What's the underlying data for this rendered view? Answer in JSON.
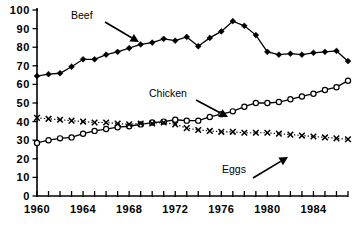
{
  "chart_data": {
    "type": "line",
    "title": "",
    "xlabel": "",
    "ylabel": "",
    "xlim": [
      1960,
      1987
    ],
    "ylim": [
      0,
      100
    ],
    "grid": false,
    "legend_position": "inline-annotations",
    "x": [
      1960,
      1961,
      1962,
      1963,
      1964,
      1965,
      1966,
      1967,
      1968,
      1969,
      1970,
      1971,
      1972,
      1973,
      1974,
      1975,
      1976,
      1977,
      1978,
      1979,
      1980,
      1981,
      1982,
      1983,
      1984,
      1985,
      1986,
      1987
    ],
    "x_tick_labels": [
      "1960",
      "1964",
      "1968",
      "1972",
      "1976",
      "1980",
      "1984"
    ],
    "x_tick_values": [
      1960,
      1964,
      1968,
      1972,
      1976,
      1980,
      1984
    ],
    "y_tick_labels": [
      "0",
      "10",
      "20",
      "30",
      "40",
      "50",
      "60",
      "70",
      "80",
      "90",
      "100"
    ],
    "y_tick_values": [
      0,
      10,
      20,
      30,
      40,
      50,
      60,
      70,
      80,
      90,
      100
    ],
    "series": [
      {
        "name": "Beef",
        "marker": "filled-diamond",
        "line": "solid",
        "values": [
          64.5,
          65.5,
          66.0,
          69.5,
          73.5,
          73.5,
          76.0,
          77.5,
          79.5,
          81.5,
          82.5,
          84.5,
          83.5,
          85.5,
          80.5,
          85.0,
          88.5,
          94.0,
          91.5,
          86.5,
          77.5,
          76.0,
          76.5,
          76.0,
          77.0,
          77.5,
          78.0,
          72.5
        ]
      },
      {
        "name": "Chicken",
        "marker": "open-circle",
        "line": "solid",
        "values": [
          28.5,
          30.0,
          31.0,
          31.5,
          33.5,
          35.0,
          36.0,
          37.0,
          37.5,
          38.5,
          39.5,
          40.0,
          41.0,
          40.5,
          40.5,
          42.5,
          44.0,
          45.5,
          48.0,
          50.0,
          50.0,
          50.5,
          52.0,
          53.5,
          55.0,
          57.0,
          58.5,
          62.0
        ]
      },
      {
        "name": "Eggs",
        "marker": "x-cross",
        "line": "dotted",
        "values": [
          42.0,
          41.5,
          41.0,
          40.5,
          40.0,
          39.5,
          39.5,
          39.0,
          38.5,
          39.0,
          39.0,
          39.5,
          38.5,
          36.5,
          35.5,
          35.0,
          34.5,
          34.5,
          34.0,
          34.0,
          34.0,
          33.5,
          33.0,
          32.5,
          32.0,
          31.5,
          31.0,
          30.5
        ]
      }
    ],
    "annotations": [
      {
        "text": "Beef",
        "label_x": 71,
        "label_y": 19
      },
      {
        "text": "Chicken",
        "label_x": 149,
        "label_y": 97
      },
      {
        "text": "Eggs",
        "label_x": 222,
        "label_y": 173
      }
    ]
  }
}
